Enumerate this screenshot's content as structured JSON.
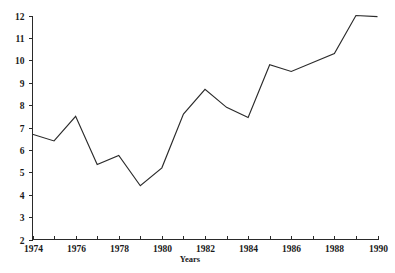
{
  "chart_data": {
    "type": "line",
    "title": "",
    "xlabel": "Years",
    "ylabel": "",
    "x": [
      1974,
      1975,
      1976,
      1977,
      1978,
      1979,
      1980,
      1981,
      1982,
      1983,
      1984,
      1985,
      1986,
      1987,
      1988,
      1989,
      1990
    ],
    "values": [
      6.7,
      6.4,
      7.5,
      5.35,
      5.75,
      4.4,
      5.2,
      7.6,
      8.7,
      7.9,
      7.45,
      9.8,
      9.5,
      9.9,
      10.3,
      12.0,
      11.95
    ],
    "series": [
      {
        "name": "",
        "values": [
          6.7,
          6.4,
          7.5,
          5.35,
          5.75,
          4.4,
          5.2,
          7.6,
          8.7,
          7.9,
          7.45,
          9.8,
          9.5,
          9.9,
          10.3,
          12.0,
          11.95
        ]
      }
    ],
    "xlim": [
      1974,
      1990
    ],
    "ylim": [
      2,
      12
    ],
    "y_ticks": [
      2,
      3,
      4,
      5,
      6,
      7,
      8,
      9,
      10,
      11,
      12
    ],
    "y_tick_labels": [
      "2",
      "3",
      "4",
      "5",
      "6",
      "7",
      "8",
      "9",
      "10",
      "11",
      "12"
    ],
    "x_ticks": [
      1974,
      1975,
      1976,
      1977,
      1978,
      1979,
      1980,
      1981,
      1982,
      1983,
      1984,
      1985,
      1986,
      1987,
      1988,
      1989,
      1990
    ],
    "x_tick_labels": [
      "1974",
      "",
      "1976",
      "",
      "1978",
      "",
      "1980",
      "",
      "1982",
      "",
      "1984",
      "",
      "1986",
      "",
      "1988",
      "",
      "1990"
    ],
    "x_major_labels": [
      "1974",
      "1976",
      "1978",
      "1980",
      "1982",
      "1984",
      "1986",
      "1988",
      "1990"
    ],
    "grid": false,
    "legend": false,
    "legend_position": "none",
    "line_color": "#2b2b2b",
    "axis_color": "#2a2a2a",
    "background_color": "#ffffff"
  }
}
